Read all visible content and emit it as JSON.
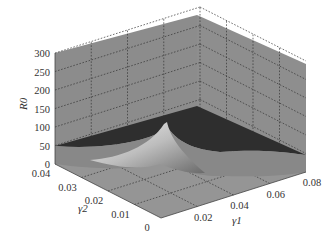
{
  "chart_data": {
    "type": "surface3d",
    "title": "",
    "xlabel": "γ1",
    "ylabel": "γ2",
    "zlabel": "R0",
    "x_ticks": [
      "0.02",
      "0.04",
      "0.06",
      "0.08"
    ],
    "y_ticks": [
      "0",
      "0.01",
      "0.02",
      "0.03",
      "0.04"
    ],
    "z_ticks": [
      "0",
      "50",
      "100",
      "150",
      "200",
      "250",
      "300"
    ],
    "xlim": [
      0,
      0.08
    ],
    "ylim": [
      0,
      0.04
    ],
    "zlim": [
      0,
      300
    ],
    "grid": true,
    "surface": {
      "description": "R0 surface over (γ1, γ2); plateau near 50 at large γ1, sharp peak (~120+) as γ1 and γ2 approach 0",
      "x": [
        0.0,
        0.01,
        0.02,
        0.04,
        0.06,
        0.08
      ],
      "y": [
        0.0,
        0.01,
        0.02,
        0.03,
        0.04
      ],
      "z_peak": 120,
      "z_plateau": 50
    },
    "colors": {
      "pane": "#8c8c8c",
      "surface_dark": "#2e2e2e",
      "surface_light": "#d8d8d8"
    }
  }
}
